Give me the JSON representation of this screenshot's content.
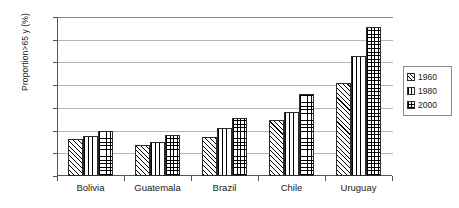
{
  "chart_data": {
    "type": "bar",
    "title": "",
    "xlabel": "",
    "ylabel": "Proportion>65 y (%)",
    "ylim": [
      0,
      14
    ],
    "yticks": [
      0,
      2,
      4,
      6,
      8,
      10,
      12,
      14
    ],
    "ytick_labels": [
      "0",
      "2",
      "4",
      "6",
      "8",
      "10",
      "12",
      "14"
    ],
    "grid": true,
    "grid_axis": "y",
    "legend_position": "right-outside",
    "categories": [
      "Bolivia",
      "Guatemala",
      "Brazil",
      "Chile",
      "Uruguay"
    ],
    "series": [
      {
        "name": "1960",
        "pattern": "diagonal-hatch",
        "values": [
          3.3,
          2.7,
          3.4,
          4.9,
          8.2
        ]
      },
      {
        "name": "1980",
        "pattern": "vertical-lines",
        "values": [
          3.5,
          3.0,
          4.2,
          5.6,
          10.6
        ]
      },
      {
        "name": "2000",
        "pattern": "crosshatch-grid",
        "values": [
          4.0,
          3.6,
          5.1,
          7.2,
          13.1
        ]
      }
    ],
    "colors": {
      "bar_outline": "#2b2b2b",
      "bar_fill": "#ffffff",
      "gridline": "#b6b6b6",
      "axis": "#555555",
      "text": "#1a1a1a",
      "legend_border": "#8c8c8c"
    }
  },
  "legend": {
    "items": [
      {
        "label": "1960"
      },
      {
        "label": "1980"
      },
      {
        "label": "2000"
      }
    ]
  }
}
